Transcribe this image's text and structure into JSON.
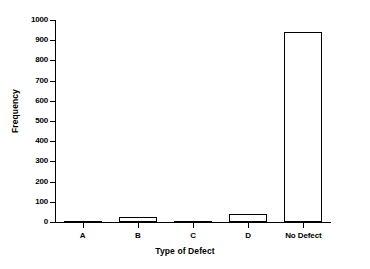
{
  "chart_data": {
    "type": "bar",
    "title": "",
    "subtitle": "",
    "xlabel": "Type of Defect",
    "ylabel": "Frequency",
    "categories": [
      "A",
      "B",
      "C",
      "D",
      "No Defect"
    ],
    "values": [
      2,
      25,
      7,
      38,
      940
    ],
    "series": [
      {
        "name": "Frequency",
        "values": [
          2,
          25,
          7,
          38,
          940
        ]
      }
    ],
    "ylim": [
      0,
      1000
    ],
    "ytick_labels": [
      "0",
      "100",
      "200",
      "300",
      "400",
      "500",
      "600",
      "700",
      "800",
      "900",
      "1000"
    ],
    "ytick_values": [
      0,
      100,
      200,
      300,
      400,
      500,
      600,
      700,
      800,
      900,
      1000
    ],
    "grid": false,
    "legend": false,
    "legend_position": "none",
    "bar_fill_color": "#ffffff",
    "bar_edge_color": "#000000",
    "axis_color": "#000000",
    "background_color": "#ffffff",
    "annotations": []
  }
}
